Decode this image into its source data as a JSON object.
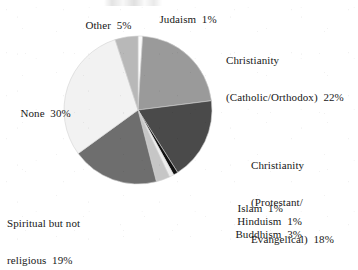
{
  "chart_data": {
    "type": "pie",
    "title": "",
    "xlabel": "",
    "ylabel": "",
    "legend_position": "none",
    "grid": false,
    "labels_outside": true,
    "start_angle_deg": 0,
    "direction": "clockwise",
    "categories": [
      "Judaism",
      "Christianity (Catholic/Orthodox)",
      "Christianity (Protestant/Evangelical)",
      "Islam",
      "Hinduism",
      "Buddhism",
      "Spiritual but not religious",
      "None",
      "Other"
    ],
    "values": [
      1,
      22,
      18,
      1,
      1,
      3,
      19,
      30,
      5
    ],
    "unit": "%",
    "total": 100,
    "slices": [
      {
        "name": "Judaism",
        "label_line1": "Judaism  1%",
        "label_line2": "",
        "value": 1,
        "display": "1%",
        "color": "#fbfbfb",
        "start_deg": 0,
        "end_deg": 3.6
      },
      {
        "name": "Christianity (Catholic/Orthodox)",
        "label_line1": "Christianity",
        "label_line2": "(Catholic/Orthodox)  22%",
        "value": 22,
        "display": "22%",
        "color": "#9a9a9a",
        "start_deg": 3.6,
        "end_deg": 82.8
      },
      {
        "name": "Christianity (Protestant/Evangelical)",
        "label_line1": "Christianity",
        "label_line2": "(Protestant/",
        "label_line3": "Evangelical)  18%",
        "value": 18,
        "display": "18%",
        "color": "#4a4a4a",
        "start_deg": 82.8,
        "end_deg": 147.6
      },
      {
        "name": "Islam",
        "label_line1": "Islam  1%",
        "value": 1,
        "display": "1%",
        "color": "#111111",
        "start_deg": 147.6,
        "end_deg": 151.2
      },
      {
        "name": "Hinduism",
        "label_line1": "Hinduism  1%",
        "value": 1,
        "display": "1%",
        "color": "#ededed",
        "start_deg": 151.2,
        "end_deg": 154.8
      },
      {
        "name": "Buddhism",
        "label_line1": "Buddhism  3%",
        "value": 3,
        "display": "3%",
        "color": "#c6c6c6",
        "start_deg": 154.8,
        "end_deg": 165.6
      },
      {
        "name": "Spiritual but not religious",
        "label_line1": "Spiritual but not",
        "label_line2": "religious  19%",
        "value": 19,
        "display": "19%",
        "color": "#6e6e6e",
        "start_deg": 165.6,
        "end_deg": 234.0
      },
      {
        "name": "None",
        "label_line1": "None  30%",
        "value": 30,
        "display": "30%",
        "color": "#f2f2f2",
        "start_deg": 234.0,
        "end_deg": 342.0
      },
      {
        "name": "Other",
        "label_line1": "Other  5%",
        "value": 5,
        "display": "5%",
        "color": "#b8b8b8",
        "start_deg": 342.0,
        "end_deg": 360.0
      }
    ]
  },
  "labels": {
    "other": "Other  5%",
    "judaism": "Judaism  1%",
    "catholic_line1": "Christianity",
    "catholic_line2": "(Catholic/Orthodox)  22%",
    "protestant_line1": "Christianity",
    "protestant_line2": "(Protestant/",
    "protestant_line3": "Evangelical)  18%",
    "islam": "Islam  1%",
    "hinduism": "Hinduism  1%",
    "buddhism": "Buddhism  3%",
    "spiritual_line1": "Spiritual but not",
    "spiritual_line2": "religious  19%",
    "none": "None  30%"
  },
  "geometry": {
    "cx": 138,
    "cy": 110,
    "r": 74
  }
}
